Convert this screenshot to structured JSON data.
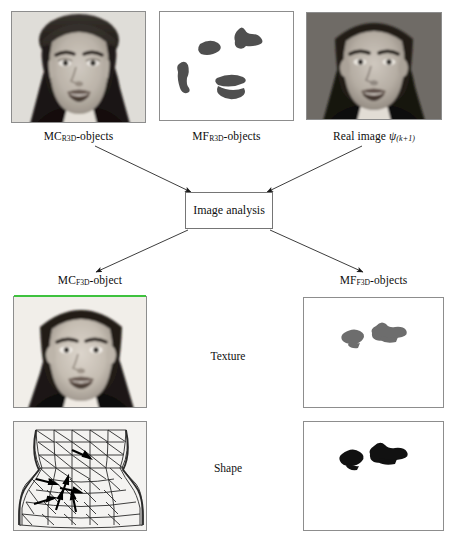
{
  "figure": {
    "type": "diagram"
  },
  "panels": {
    "top_left": {
      "label_prefix": "MC",
      "label_sub": "R3D",
      "label_suffix": "-objects",
      "label_full": "MC R3D-objects",
      "content": "synthetic-grey-face-photo"
    },
    "top_middle": {
      "label_prefix": "MF",
      "label_sub": "R3D",
      "label_suffix": "-objects",
      "label_full": "MF R3D-objects",
      "content": "binary-blob-facial-features"
    },
    "top_right": {
      "label_prefix": "Real image ",
      "label_sym": "ψ",
      "label_sub": "(k+1)",
      "label_full": "Real image ψ(k+1)",
      "content": "grey-face-photo-dark-background"
    },
    "bottom_left_texture": {
      "label_prefix": "MC",
      "label_sub": "F3D",
      "label_suffix": "-object",
      "label_full": "MC F3D-object",
      "content": "grey-face-photo-texture"
    },
    "bottom_left_shape": {
      "content": "wireframe-triangular-mesh-head-with-motion-arrows"
    },
    "bottom_right_texture": {
      "label_prefix": "MF",
      "label_sub": "F3D",
      "label_suffix": "-objects",
      "label_full": "MF F3D-objects",
      "content": "two-grey-blobs"
    },
    "bottom_right_shape": {
      "content": "two-black-blobs"
    }
  },
  "process": {
    "box_label": "Image analysis"
  },
  "row_labels": {
    "texture": "Texture",
    "shape": "Shape"
  },
  "colors": {
    "panel_border": "#8d8d8d",
    "box_border": "#757575",
    "arrow": "#1a1a1a",
    "text": "#0d0d0d",
    "artifact_green": "#3ec23e",
    "blob_grey": "#6d6d6d",
    "blob_black": "#111111"
  }
}
